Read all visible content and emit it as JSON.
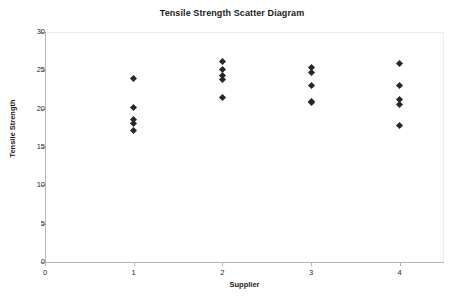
{
  "chart_data": {
    "type": "scatter",
    "title": "Tensile Strength Scatter Diagram",
    "xlabel": "Supplier",
    "ylabel": "Tensile Strength",
    "xlim": [
      0,
      4.5
    ],
    "ylim": [
      0,
      30
    ],
    "x_ticks": [
      0,
      1,
      2,
      3,
      4
    ],
    "x_tick_labels": [
      "0",
      "1",
      "2",
      "3",
      "4"
    ],
    "y_ticks": [
      0,
      5,
      10,
      15,
      20,
      25,
      30
    ],
    "y_tick_labels": [
      "0",
      "5",
      "10",
      "15",
      "20",
      "25",
      "30"
    ],
    "grid": false,
    "legend": false,
    "marker": "diamond",
    "marker_color": "#272727",
    "series": [
      {
        "name": "Tensile Strength",
        "points": [
          {
            "x": 1,
            "y": 24.0
          },
          {
            "x": 1,
            "y": 20.2
          },
          {
            "x": 1,
            "y": 18.6
          },
          {
            "x": 1,
            "y": 18.1
          },
          {
            "x": 1,
            "y": 17.1
          },
          {
            "x": 2,
            "y": 26.2
          },
          {
            "x": 2,
            "y": 25.1
          },
          {
            "x": 2,
            "y": 24.3
          },
          {
            "x": 2,
            "y": 23.8
          },
          {
            "x": 2,
            "y": 21.4
          },
          {
            "x": 3,
            "y": 25.4
          },
          {
            "x": 3,
            "y": 24.7
          },
          {
            "x": 3,
            "y": 23.0
          },
          {
            "x": 3,
            "y": 21.0
          },
          {
            "x": 3,
            "y": 20.8
          },
          {
            "x": 4,
            "y": 25.9
          },
          {
            "x": 4,
            "y": 23.0
          },
          {
            "x": 4,
            "y": 21.2
          },
          {
            "x": 4,
            "y": 20.5
          },
          {
            "x": 4,
            "y": 17.8
          }
        ]
      }
    ]
  }
}
